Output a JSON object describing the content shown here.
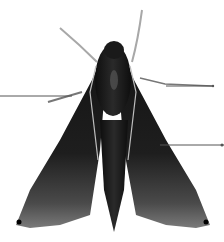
{
  "image": {
    "subject": "hawk moth specimen, dorsal view",
    "background": "#ffffff",
    "colors": {
      "body": "#1a1a1a",
      "wing_dark": "#202020",
      "wing_edge": "#6a6a6a",
      "stripe": "#bdbdbd",
      "antenna": "#a8a8a8",
      "leader_line": "#555555"
    }
  },
  "annotations": [
    {
      "id": "leader-left",
      "from": [
        0,
        96
      ],
      "to": [
        72,
        96
      ],
      "label": ""
    },
    {
      "id": "leader-right-upper",
      "from": [
        166,
        86
      ],
      "to": [
        214,
        86
      ],
      "label": ""
    },
    {
      "id": "leader-right-lower",
      "from": [
        160,
        145
      ],
      "to": [
        224,
        145
      ],
      "label": ""
    }
  ]
}
